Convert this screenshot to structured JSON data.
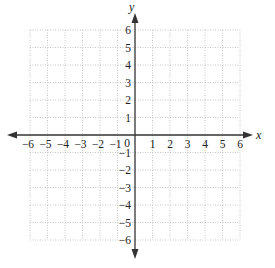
{
  "diagram": {
    "type": "coordinate_plane",
    "x_axis": {
      "label": "x",
      "min": -6,
      "max": 6,
      "ticks": [
        "-6",
        "-5",
        "-4",
        "-3",
        "-2",
        "-1",
        "0",
        "1",
        "2",
        "3",
        "4",
        "5",
        "6"
      ]
    },
    "y_axis": {
      "label": "y",
      "min": -6,
      "max": 6,
      "ticks": [
        "6",
        "5",
        "4",
        "3",
        "2",
        "1",
        "-1",
        "-2",
        "-3",
        "-4",
        "-5",
        "-6"
      ]
    },
    "origin_label": "0",
    "grid": {
      "style": "dotted",
      "step": 1,
      "color": "#b8b8b8"
    },
    "axis_color": "#333333"
  },
  "x_ticks": [
    {
      "v": -6,
      "t": "−6"
    },
    {
      "v": -5,
      "t": "−5"
    },
    {
      "v": -4,
      "t": "−4"
    },
    {
      "v": -3,
      "t": "−3"
    },
    {
      "v": -2,
      "t": "−2"
    },
    {
      "v": -1,
      "t": "−1"
    },
    {
      "v": 1,
      "t": "1"
    },
    {
      "v": 2,
      "t": "2"
    },
    {
      "v": 3,
      "t": "3"
    },
    {
      "v": 4,
      "t": "4"
    },
    {
      "v": 5,
      "t": "5"
    },
    {
      "v": 6,
      "t": "6"
    }
  ],
  "y_ticks": [
    {
      "v": 6,
      "t": "6"
    },
    {
      "v": 5,
      "t": "5"
    },
    {
      "v": 4,
      "t": "4"
    },
    {
      "v": 3,
      "t": "3"
    },
    {
      "v": 2,
      "t": "2"
    },
    {
      "v": 1,
      "t": "1"
    },
    {
      "v": -1,
      "t": "−1"
    },
    {
      "v": -2,
      "t": "−2"
    },
    {
      "v": -3,
      "t": "−3"
    },
    {
      "v": -4,
      "t": "−4"
    },
    {
      "v": -5,
      "t": "−5"
    },
    {
      "v": -6,
      "t": "−6"
    }
  ]
}
